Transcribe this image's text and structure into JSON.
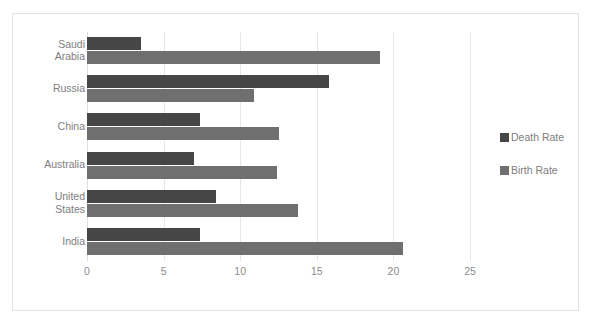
{
  "chart_data": {
    "type": "bar",
    "orientation": "horizontal",
    "title": "",
    "xlabel": "",
    "ylabel": "",
    "xlim": [
      0,
      25
    ],
    "xticks": [
      "0",
      "5",
      "10",
      "15",
      "20",
      "25"
    ],
    "xtick_values": [
      0,
      5,
      10,
      15,
      20,
      25
    ],
    "grid": true,
    "legend_position": "right",
    "categories": [
      "Saudi\nArabia",
      "Russia",
      "China",
      "Australia",
      "United\nStates",
      "India"
    ],
    "series": [
      {
        "name": "Death Rate",
        "color": "#464646",
        "values": [
          3.5,
          15.8,
          7.4,
          7.0,
          8.4,
          7.4
        ]
      },
      {
        "name": "Birth Rate",
        "color": "#6f6f6f",
        "values": [
          19.1,
          10.9,
          12.5,
          12.4,
          13.8,
          20.6
        ]
      }
    ]
  },
  "legend": {
    "items": [
      {
        "label": "Death Rate",
        "color": "#464646"
      },
      {
        "label": "Birth Rate",
        "color": "#6f6f6f"
      }
    ]
  },
  "colors": {
    "death_rate": "#464646",
    "birth_rate": "#6f6f6f",
    "gridline": "#e6e6e6",
    "text": "#7d7d7d",
    "frame": "#e2e2e2",
    "background": "#ffffff"
  }
}
